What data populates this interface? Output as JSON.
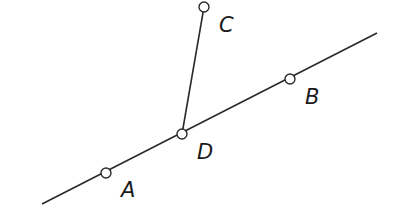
{
  "diagram": {
    "stroke_color": "#2a2a2a",
    "background": "#ffffff",
    "line_AB": {
      "x1": 42,
      "y1": 204,
      "x2": 377,
      "y2": 33
    },
    "segment_DC": {
      "from": "D",
      "to": "C"
    },
    "points": [
      {
        "name": "A",
        "label": "A",
        "x": 106,
        "y": 173,
        "lx": 121,
        "ly": 197
      },
      {
        "name": "B",
        "label": "B",
        "x": 290,
        "y": 79,
        "lx": 305,
        "ly": 104
      },
      {
        "name": "C",
        "label": "C",
        "x": 204,
        "y": 7,
        "lx": 219,
        "ly": 32
      },
      {
        "name": "D",
        "label": "D",
        "x": 182,
        "y": 134,
        "lx": 197,
        "ly": 159
      }
    ]
  }
}
